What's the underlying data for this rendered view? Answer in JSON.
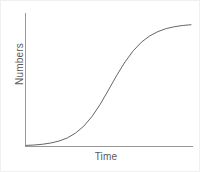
{
  "chart_data": {
    "type": "line",
    "title": "",
    "subtitle": "",
    "xlabel": "Time",
    "ylabel": "Numbers",
    "grid": false,
    "legend": null,
    "legend_position": "none",
    "xlim": [
      0,
      1
    ],
    "ylim": [
      0,
      1
    ],
    "xticks": [],
    "yticks": [],
    "xticklabels": [],
    "yticklabels": [],
    "annotations": [],
    "series": [
      {
        "name": "logistic growth",
        "color": "#666666",
        "linewidth": 1,
        "x": [
          0.0,
          0.05,
          0.1,
          0.15,
          0.2,
          0.25,
          0.3,
          0.35,
          0.4,
          0.45,
          0.5,
          0.55,
          0.6,
          0.65,
          0.7,
          0.75,
          0.8,
          0.85,
          0.9,
          0.95,
          1.0
        ],
        "y": [
          0.005,
          0.008,
          0.014,
          0.024,
          0.04,
          0.065,
          0.104,
          0.16,
          0.238,
          0.337,
          0.452,
          0.57,
          0.678,
          0.768,
          0.838,
          0.888,
          0.923,
          0.947,
          0.962,
          0.972,
          0.978
        ]
      }
    ]
  },
  "axes": {
    "axis_color": "#999999",
    "axis_linewidth": 1,
    "curve_color": "#666666",
    "background": "#ffffff",
    "label_color": "#5a5a5a"
  }
}
